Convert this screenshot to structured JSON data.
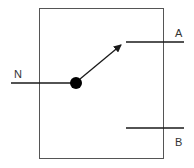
{
  "diagram": {
    "type": "SPDT switch schematic",
    "labels": {
      "common": "N",
      "throw_a": "A",
      "throw_b": "B"
    },
    "colors": {
      "stroke": "#1a1a1a",
      "box": "#555555",
      "background": "#ffffff"
    },
    "switch_position": "A"
  }
}
